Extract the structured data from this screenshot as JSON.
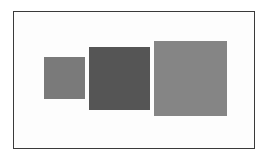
{
  "frame": {
    "border_color": "#3a3a3a",
    "background": "#fdfdfd"
  },
  "squares": [
    {
      "name": "small-square",
      "left": 44,
      "top": 57,
      "width": 41,
      "height": 42,
      "color": "#7a7a7a"
    },
    {
      "name": "medium-square",
      "left": 89,
      "top": 47,
      "width": 61,
      "height": 63,
      "color": "#555555"
    },
    {
      "name": "large-square",
      "left": 154,
      "top": 41,
      "width": 73,
      "height": 75,
      "color": "#858585"
    }
  ]
}
